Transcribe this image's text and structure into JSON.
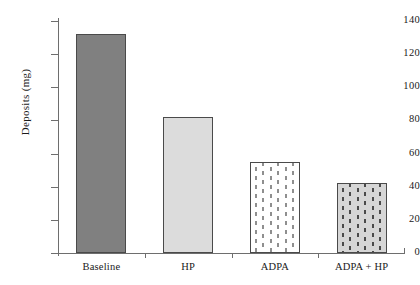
{
  "chart_data": {
    "type": "bar",
    "title": "",
    "xlabel": "",
    "ylabel": "Deposits (mg)",
    "categories": [
      "Baseline",
      "HP",
      "ADPA",
      "ADPA + HP"
    ],
    "values": [
      132,
      82,
      55,
      42
    ],
    "ylim": [
      0,
      140
    ],
    "y_ticks": [
      0,
      20,
      40,
      60,
      80,
      100,
      120,
      140
    ],
    "y_tick_labels": [
      "0",
      "20",
      "40",
      "60",
      "80",
      "100",
      "120",
      "140"
    ],
    "grid": false,
    "legend": null,
    "bar_styles": [
      {
        "category": "Baseline",
        "fill": "solid",
        "color": "#808080",
        "edge": "#4a4a4a"
      },
      {
        "category": "HP",
        "fill": "solid",
        "color": "#dcdcdc",
        "edge": "#4a4a4a"
      },
      {
        "category": "ADPA",
        "fill": "dashes",
        "color": "#ffffff",
        "pattern_color": "#8f8f8f",
        "edge": "#4a4a4a"
      },
      {
        "category": "ADPA + HP",
        "fill": "dashes",
        "color": "#d6d6d6",
        "pattern_color": "#4a4a4a",
        "edge": "#4a4a4a"
      }
    ],
    "axis_color": "#6e6e6e",
    "background": "#ffffff"
  }
}
